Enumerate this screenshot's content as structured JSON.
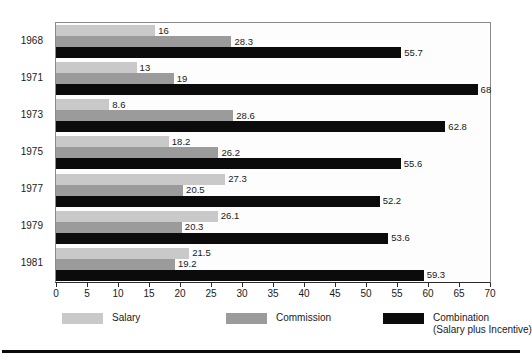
{
  "chart_data": {
    "type": "bar",
    "orientation": "horizontal",
    "title": "",
    "subtitle": "",
    "xlabel": "",
    "ylabel": "",
    "categories": [
      "1968",
      "1971",
      "1973",
      "1975",
      "1977",
      "1979",
      "1981"
    ],
    "series": [
      {
        "name": "Salary",
        "color": "#c9c9c9",
        "values": [
          16,
          13,
          8.6,
          18.2,
          27.3,
          26.1,
          21.5
        ],
        "labels": [
          "16",
          "13",
          "8.6",
          "18.2",
          "27.3",
          "26.1",
          "21.5"
        ]
      },
      {
        "name": "Commission",
        "color": "#9b9b9b",
        "values": [
          28.3,
          19,
          28.6,
          26.2,
          20.5,
          20.3,
          19.2
        ],
        "labels": [
          "28.3",
          "19",
          "28.6",
          "26.2",
          "20.5",
          "20.3",
          "19.2"
        ]
      },
      {
        "name": "Combination",
        "color": "#0b0b0b",
        "values": [
          55.7,
          68,
          62.8,
          55.6,
          52.2,
          53.6,
          59.3
        ],
        "labels": [
          "55.7",
          "68",
          "62.8",
          "55.6",
          "52.2",
          "53.6",
          "59.3"
        ]
      }
    ],
    "xlim": [
      0,
      70
    ],
    "xticks": [
      0,
      5,
      10,
      15,
      20,
      25,
      30,
      35,
      40,
      45,
      50,
      55,
      60,
      65,
      70
    ],
    "xtick_labels": [
      "0",
      "5",
      "10",
      "15",
      "20",
      "25",
      "30",
      "35",
      "40",
      "45",
      "50",
      "55",
      "60",
      "65",
      "70"
    ],
    "grid": false,
    "legend_position": "bottom",
    "legend": [
      {
        "label": "Salary",
        "sublabel": "",
        "color": "#c9c9c9"
      },
      {
        "label": "Commission",
        "sublabel": "",
        "color": "#9b9b9b"
      },
      {
        "label": "Combination",
        "sublabel": "(Salary plus Incentive)",
        "color": "#0b0b0b"
      }
    ]
  }
}
